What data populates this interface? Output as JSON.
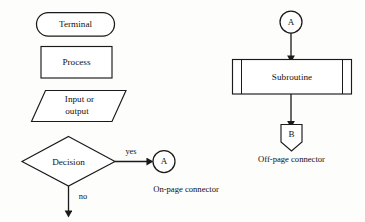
{
  "diagram": {
    "background_color": "#fdfdfc",
    "stroke_color": "#1a1a1a",
    "text_color": "#111111",
    "left_column": {
      "terminal": {
        "label": "Terminal",
        "shape": "stadium"
      },
      "process": {
        "label": "Process",
        "shape": "rectangle"
      },
      "input_output": {
        "label_line1": "Input or",
        "label_line2": "output",
        "shape": "parallelogram"
      },
      "decision": {
        "label": "Decision",
        "shape": "diamond",
        "branch_yes": "yes",
        "branch_no": "no"
      },
      "on_page_connector": {
        "letter": "A",
        "caption": "On-page connector",
        "shape": "circle"
      }
    },
    "right_column": {
      "entry_connector": {
        "letter": "A",
        "shape": "circle"
      },
      "subroutine": {
        "label": "Subroutine",
        "shape": "rectangle-with-side-bars"
      },
      "off_page_connector": {
        "letter": "B",
        "caption": "Off-page connector",
        "shape": "pentagon-down"
      }
    }
  }
}
